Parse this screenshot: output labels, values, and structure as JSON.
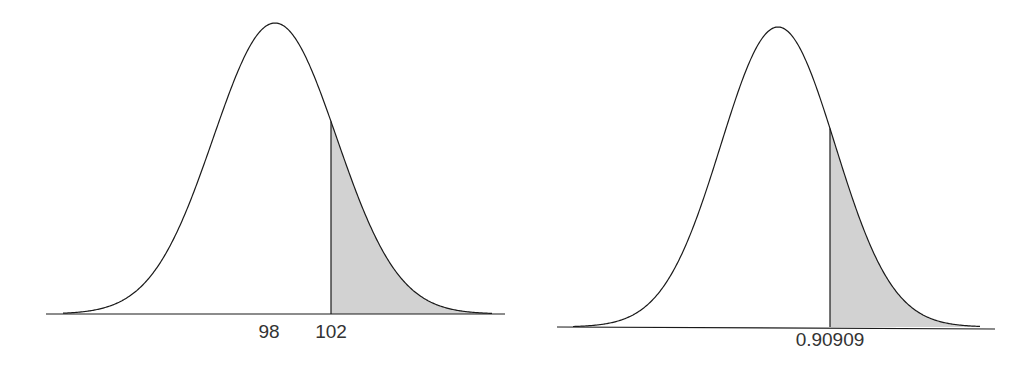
{
  "chart_data": [
    {
      "type": "area",
      "title": "",
      "description": "Normal distribution curve with shaded right tail beyond cutoff",
      "distribution": "normal",
      "mean": 98,
      "sd": 4.4,
      "shade_from": 102,
      "shade_side": "right",
      "xlabel": "",
      "ylabel": "",
      "tick_labels": [
        "98",
        "102"
      ],
      "tick_values": [
        98,
        102
      ],
      "xlim": [
        83.6,
        110.8
      ],
      "grid": false,
      "colors": {
        "curve": "#1a1a1a",
        "shade": "#d2d2d2"
      }
    },
    {
      "type": "area",
      "title": "",
      "description": "Standard normal curve with shaded right tail beyond z cutoff",
      "distribution": "normal",
      "mean": 0,
      "sd": 1,
      "shade_from": 0.90909,
      "shade_side": "right",
      "xlabel": "",
      "ylabel": "",
      "tick_labels": [
        "0.90909"
      ],
      "tick_values": [
        0.90909
      ],
      "xlim": [
        -3.8,
        3.8
      ],
      "grid": false,
      "colors": {
        "curve": "#1a1a1a",
        "shade": "#d2d2d2"
      }
    }
  ]
}
